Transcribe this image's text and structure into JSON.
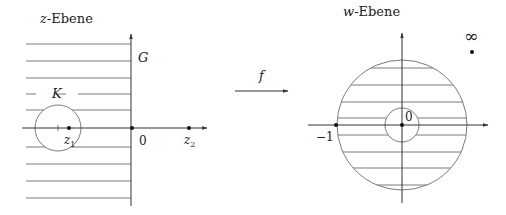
{
  "z_plane": {
    "title_var": "z",
    "title_rest": "-Ebene",
    "region_label": "G",
    "disk_label": "K",
    "points": [
      {
        "name": "z1",
        "base": "z",
        "sub": "1"
      },
      {
        "name": "origin",
        "label": "0"
      },
      {
        "name": "z2",
        "base": "z",
        "sub": "2"
      }
    ]
  },
  "mapping": {
    "label": "f"
  },
  "w_plane": {
    "title_var": "w",
    "title_rest": "-Ebene",
    "points": [
      {
        "name": "minus-one",
        "label": "−1"
      },
      {
        "name": "origin",
        "label": "0"
      },
      {
        "name": "infinity",
        "label": "∞"
      }
    ]
  },
  "colors": {
    "line": "#7a7a7a",
    "axis": "#333333",
    "point": "#111111"
  }
}
